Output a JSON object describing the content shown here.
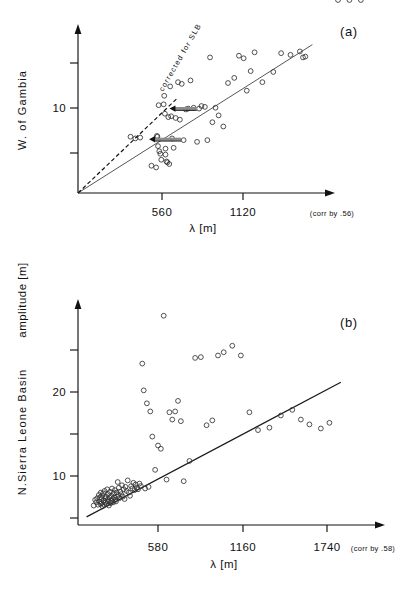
{
  "figure": {
    "axis_title_y_global": "amplitude  [m]",
    "panels": [
      {
        "id": "a",
        "label": "(a)",
        "side_title": "W. of  Gambia",
        "xlabel": "λ [m]",
        "corr_note": "(corr by .56)",
        "annotation": "corrected for SLB",
        "x_ticks": [
          {
            "value": 560,
            "label": "560"
          },
          {
            "value": 1120,
            "label": "1120"
          }
        ],
        "y_ticks": [
          {
            "value": 5,
            "label": ""
          },
          {
            "value": 10,
            "label": "10"
          },
          {
            "value": 15,
            "label": ""
          }
        ]
      },
      {
        "id": "b",
        "label": "(b)",
        "side_title": "N.Sierra Leone Basin",
        "xlabel": "λ [m]",
        "corr_note": "(corr by .58)",
        "x_ticks": [
          {
            "value": 580,
            "label": "580"
          },
          {
            "value": 1160,
            "label": "1160"
          },
          {
            "value": 1740,
            "label": "1740"
          }
        ],
        "y_ticks": [
          {
            "value": 5,
            "label": ""
          },
          {
            "value": 10,
            "label": "10"
          },
          {
            "value": 15,
            "label": ""
          },
          {
            "value": 20,
            "label": "20"
          },
          {
            "value": 25,
            "label": ""
          }
        ]
      }
    ]
  },
  "chart_data": [
    {
      "type": "scatter",
      "panel": "a",
      "title": "W. of Gambia",
      "xlabel": "λ [m]",
      "ylabel": "amplitude [m]",
      "xlim": [
        0,
        1600
      ],
      "ylim": [
        0,
        19
      ],
      "grid": false,
      "legend": "none",
      "annotations": [
        {
          "text": "corrected for SLB",
          "kind": "dashed-line-label"
        },
        {
          "text": "(corr by .56)",
          "kind": "axis-note"
        },
        {
          "text": "(a)",
          "kind": "panel-label"
        }
      ],
      "lines": [
        {
          "name": "regression",
          "style": "solid",
          "x": [
            0,
            1500
          ],
          "y": [
            0,
            17.4
          ]
        },
        {
          "name": "corrected for SLB",
          "style": "dashed",
          "x": [
            0,
            640
          ],
          "y": [
            0,
            11.2
          ]
        }
      ],
      "arrows": [
        {
          "x_from": 760,
          "y_from": 9.9,
          "x_to": 585,
          "y_to": 9.9
        },
        {
          "x_from": 660,
          "y_from": 6.3,
          "x_to": 455,
          "y_to": 6.3
        }
      ],
      "x": [
        336,
        367,
        398,
        470,
        500,
        505,
        508,
        512,
        516,
        520,
        527,
        533,
        548,
        552,
        556,
        560,
        560,
        566,
        572,
        578,
        584,
        590,
        596,
        602,
        612,
        625,
        640,
        652,
        664,
        676,
        690,
        705,
        720,
        740,
        762,
        775,
        790,
        812,
        828,
        845,
        860,
        880,
        900,
        930,
        960,
        1000,
        1030,
        1060,
        1080,
        1105,
        1130,
        1180,
        1250,
        1300,
        1360,
        1420,
        1440,
        1455
      ],
      "y": [
        6.6,
        6.4,
        6.5,
        3.2,
        3.0,
        6.7,
        6.6,
        5.5,
        10.3,
        4.9,
        4.6,
        3.9,
        10.4,
        11.4,
        9.3,
        5.2,
        4.5,
        3.7,
        3.6,
        8.9,
        3.4,
        12.5,
        9.0,
        6.4,
        5.3,
        8.8,
        13.0,
        8.6,
        12.8,
        6.2,
        9.8,
        9.9,
        13.2,
        10.0,
        6.0,
        9.9,
        10.2,
        10.1,
        6.2,
        15.9,
        8.3,
        10.0,
        9.1,
        7.8,
        12.9,
        13.5,
        16.1,
        15.8,
        12.0,
        14.3,
        16.5,
        13.0,
        14.2,
        16.4,
        16.2,
        16.6,
        15.9,
        16.0
      ]
    },
    {
      "type": "scatter",
      "panel": "b",
      "title": "N. Sierra Leone Basin",
      "xlabel": "λ [m]",
      "ylabel": "amplitude [m]",
      "xlim": [
        0,
        2100
      ],
      "ylim": [
        0,
        27
      ],
      "grid": false,
      "legend": "none",
      "annotations": [
        {
          "text": "(corr by .58)",
          "kind": "axis-note"
        },
        {
          "text": "(b)",
          "kind": "panel-label"
        }
      ],
      "lines": [
        {
          "name": "regression",
          "style": "solid",
          "x": [
            60,
            1840
          ],
          "y": [
            1.0,
            17.6
          ]
        }
      ],
      "x": [
        110,
        120,
        128,
        134,
        140,
        146,
        150,
        154,
        158,
        160,
        163,
        166,
        170,
        172,
        176,
        180,
        182,
        186,
        190,
        192,
        196,
        200,
        204,
        206,
        210,
        212,
        216,
        220,
        224,
        228,
        230,
        234,
        238,
        242,
        246,
        250,
        254,
        258,
        262,
        266,
        270,
        274,
        278,
        282,
        286,
        290,
        296,
        302,
        308,
        314,
        320,
        326,
        332,
        340,
        348,
        356,
        364,
        372,
        380,
        388,
        396,
        404,
        412,
        420,
        430,
        440,
        450,
        460,
        470,
        482,
        494,
        506,
        520,
        540,
        560,
        580,
        600,
        620,
        640,
        660,
        680,
        700,
        720,
        740,
        780,
        820,
        860,
        900,
        940,
        980,
        1020,
        1080,
        1140,
        1200,
        1260,
        1340,
        1420,
        1500,
        1560,
        1620,
        1700,
        1760,
        1820,
        1900,
        1980
      ],
      "y": [
        2.4,
        3.1,
        2.8,
        3.3,
        2.5,
        3.7,
        2.9,
        3.4,
        2.6,
        4.0,
        3.2,
        2.7,
        3.6,
        2.3,
        3.9,
        3.0,
        2.5,
        4.2,
        3.3,
        2.8,
        3.5,
        2.6,
        4.4,
        3.1,
        2.9,
        3.8,
        2.4,
        3.4,
        4.1,
        3.0,
        2.7,
        3.6,
        4.5,
        3.2,
        2.8,
        3.9,
        3.4,
        4.3,
        3.1,
        2.9,
        4.0,
        3.5,
        5.3,
        3.7,
        4.6,
        3.3,
        4.1,
        3.8,
        4.9,
        3.5,
        4.4,
        3.2,
        4.7,
        4.2,
        5.5,
        4.0,
        3.6,
        4.8,
        4.5,
        5.2,
        4.3,
        5.0,
        4.6,
        4.4,
        5.1,
        4.8,
        19.9,
        16.6,
        4.5,
        15.0,
        4.7,
        14.0,
        10.9,
        6.8,
        9.8,
        9.4,
        25.8,
        5.6,
        13.9,
        13.0,
        14.0,
        15.3,
        12.8,
        5.4,
        7.9,
        20.6,
        20.7,
        12.3,
        12.9,
        20.9,
        21.3,
        22.1,
        20.9,
        13.9,
        11.7,
        12.0,
        13.5,
        14.2,
        13.0,
        12.4,
        11.9,
        12.6
      ]
    }
  ]
}
